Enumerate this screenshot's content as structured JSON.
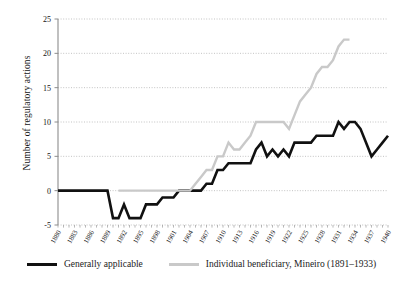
{
  "chart_data": {
    "type": "line",
    "title": "",
    "subtitle": "",
    "xlabel": "",
    "ylabel": "Number of regulatory actions",
    "xlim": [
      1880,
      1940
    ],
    "ylim": [
      -5,
      25
    ],
    "yticks": [
      -5,
      0,
      5,
      10,
      15,
      20,
      25
    ],
    "xticks": [
      1880,
      1883,
      1886,
      1889,
      1892,
      1895,
      1898,
      1901,
      1904,
      1907,
      1910,
      1913,
      1916,
      1919,
      1922,
      1925,
      1928,
      1931,
      1934,
      1937,
      1940
    ],
    "grid": "horizontal-dotted",
    "legend_position": "bottom",
    "series": [
      {
        "name": "Generally applicable",
        "color": "#111111",
        "x": [
          1880,
          1881,
          1882,
          1883,
          1884,
          1885,
          1886,
          1887,
          1888,
          1889,
          1890,
          1891,
          1892,
          1893,
          1894,
          1895,
          1896,
          1897,
          1898,
          1899,
          1900,
          1901,
          1902,
          1903,
          1904,
          1905,
          1906,
          1907,
          1908,
          1909,
          1910,
          1911,
          1912,
          1913,
          1914,
          1915,
          1916,
          1917,
          1918,
          1919,
          1920,
          1921,
          1922,
          1923,
          1924,
          1925,
          1926,
          1927,
          1928,
          1929,
          1930,
          1931,
          1932,
          1933,
          1934,
          1935,
          1936,
          1937,
          1938,
          1939,
          1940
        ],
        "values": [
          0,
          0,
          0,
          0,
          0,
          0,
          0,
          0,
          0,
          0,
          -4,
          -4,
          -2,
          -4,
          -4,
          -4,
          -2,
          -2,
          -2,
          -1,
          -1,
          -1,
          0,
          0,
          0,
          0,
          0,
          1,
          1,
          3,
          3,
          4,
          4,
          4,
          4,
          4,
          6,
          7,
          5,
          6,
          5,
          6,
          5,
          7,
          7,
          7,
          7,
          8,
          8,
          8,
          8,
          10,
          9,
          10,
          10,
          9,
          7,
          5,
          6,
          7,
          8
        ]
      },
      {
        "name": "Individual beneficiary, Mineiro (1891–1933)",
        "color": "#c9c9c9",
        "x": [
          1891,
          1892,
          1893,
          1894,
          1895,
          1896,
          1897,
          1898,
          1899,
          1900,
          1901,
          1902,
          1903,
          1904,
          1905,
          1906,
          1907,
          1908,
          1909,
          1910,
          1911,
          1912,
          1913,
          1914,
          1915,
          1916,
          1917,
          1918,
          1919,
          1920,
          1921,
          1922,
          1923,
          1924,
          1925,
          1926,
          1927,
          1928,
          1929,
          1930,
          1931,
          1932,
          1933
        ],
        "values": [
          0,
          0,
          0,
          0,
          0,
          0,
          0,
          0,
          0,
          0,
          0,
          0,
          0,
          0,
          1,
          2,
          3,
          3,
          5,
          5,
          7,
          6,
          6,
          7,
          8,
          10,
          10,
          10,
          10,
          10,
          10,
          9,
          11,
          13,
          14,
          15,
          17,
          18,
          18,
          19,
          21,
          22,
          22
        ]
      }
    ]
  },
  "legend": {
    "entries": [
      {
        "label": "Generally applicable",
        "color": "#111111"
      },
      {
        "label": "Individual beneficiary, Mineiro (1891–1933)",
        "color": "#c9c9c9"
      }
    ]
  },
  "axes": {
    "y_title": "Number of regulatory actions"
  }
}
